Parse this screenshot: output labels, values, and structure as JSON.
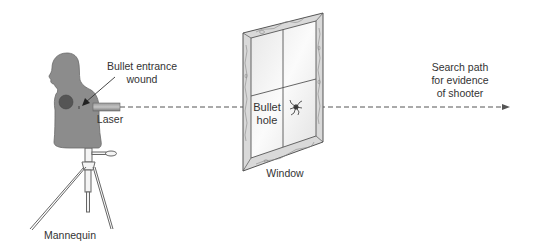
{
  "diagram": {
    "labels": {
      "entrance_wound_line1": "Bullet entrance",
      "entrance_wound_line2": "wound",
      "laser": "Laser",
      "mannequin": "Mannequin",
      "bullet_hole_line1": "Bullet",
      "bullet_hole_line2": "hole",
      "window": "Window",
      "search_path_line1": "Search path",
      "search_path_line2": "for evidence",
      "search_path_line3": "of shooter"
    },
    "components": [
      {
        "id": "mannequin",
        "description": "Gray torso mannequin on tripod stand, facing left"
      },
      {
        "id": "entrance-wound",
        "description": "Small mark on right side of mannequin chest"
      },
      {
        "id": "laser",
        "description": "Rectangular laser device aimed right"
      },
      {
        "id": "window",
        "description": "Four-pane window in wooden frame, shown in perspective"
      },
      {
        "id": "bullet-hole",
        "description": "Cracked hole in lower-right pane"
      },
      {
        "id": "laser-path",
        "description": "Dashed line from laser through bullet hole, ending in arrow"
      }
    ],
    "colors": {
      "mannequin_fill": "#8c8c8c",
      "mannequin_spot": "#555555",
      "laser_fill": "#8a8a8a",
      "frame_fill": "#d9d9d9",
      "glass_fill": "#f2f2f2",
      "line": "#444444",
      "text": "#333333"
    }
  }
}
